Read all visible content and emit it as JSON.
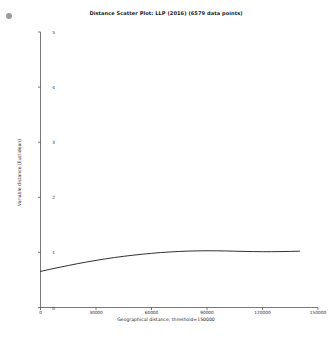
{
  "figure": {
    "background_color": "#ffffff",
    "corner_marker": "gray-dot-marker"
  },
  "chart_data": {
    "type": "line",
    "title": "Distance Scatter Plot: LLP (2016) (6579 data points)",
    "xlabel": "Geographical distance; threshold=150000",
    "ylabel": "Variable distance (Euclidean)",
    "xlim": [
      0,
      150000
    ],
    "ylim": [
      0,
      5
    ],
    "grid": false,
    "legend": null,
    "line_color": "#1a1a1a",
    "line_width": 0.9,
    "xticks": [
      0,
      30000,
      60000,
      90000,
      120000,
      150000
    ],
    "xtick_labels": [
      "0",
      "30000",
      "60000",
      "90000",
      "120000",
      "150000"
    ],
    "yticks": [
      0,
      1,
      2,
      3,
      4,
      5
    ],
    "ytick_labels": [
      "0",
      "1",
      "2",
      "3",
      "4",
      "5"
    ],
    "series": [
      {
        "name": "lowess-trend",
        "x": [
          0,
          5000,
          10000,
          15000,
          20000,
          25000,
          30000,
          35000,
          40000,
          45000,
          50000,
          55000,
          60000,
          65000,
          70000,
          75000,
          80000,
          85000,
          90000,
          95000,
          100000,
          105000,
          110000,
          115000,
          120000,
          125000,
          130000,
          135000,
          140000
        ],
        "y": [
          0.655,
          0.692,
          0.728,
          0.762,
          0.795,
          0.826,
          0.855,
          0.882,
          0.907,
          0.929,
          0.949,
          0.967,
          0.983,
          0.997,
          1.008,
          1.017,
          1.024,
          1.028,
          1.03,
          1.029,
          1.026,
          1.022,
          1.018,
          1.015,
          1.013,
          1.013,
          1.015,
          1.018,
          1.022
        ]
      }
    ]
  }
}
